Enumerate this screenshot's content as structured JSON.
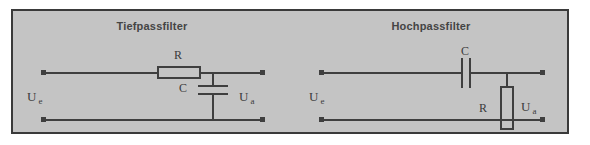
{
  "figure": {
    "panel_bg": "#c4c4c4",
    "border_color": "#3a3a3a",
    "wire_color": "#3f3f3f"
  },
  "lowpass": {
    "title": "Tiefpassfilter",
    "series_component_label": "R",
    "shunt_component_label": "C",
    "input_label": "U",
    "input_sub": "e",
    "output_label": "U",
    "output_sub": "a"
  },
  "highpass": {
    "title": "Hochpassfilter",
    "series_component_label": "C",
    "shunt_component_label": "R",
    "input_label": "U",
    "input_sub": "e",
    "output_label": "U",
    "output_sub": "a"
  }
}
